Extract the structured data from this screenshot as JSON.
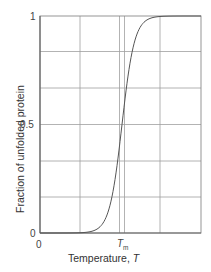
{
  "chart_data": {
    "type": "line",
    "title": "",
    "xlabel": "Temperature, T",
    "ylabel": "Fraction of unfolded protein",
    "x_tick_labels": [
      "0",
      "Tm"
    ],
    "y_tick_labels": [
      "0",
      "0.5",
      "1"
    ],
    "ylim": [
      0,
      1
    ],
    "xlim": [
      0,
      1
    ],
    "grid": true,
    "annotations": [
      {
        "text": "Tm",
        "x": 0.5,
        "description": "melting temperature, where fraction unfolded = 0.5"
      }
    ],
    "series": [
      {
        "name": "Fraction of unfolded protein",
        "x": [
          0.0,
          0.1,
          0.2,
          0.3,
          0.35,
          0.4,
          0.45,
          0.48,
          0.5,
          0.52,
          0.55,
          0.6,
          0.65,
          0.7,
          0.8,
          0.9,
          1.0
        ],
        "values": [
          0.0,
          0.003,
          0.01,
          0.03,
          0.06,
          0.12,
          0.25,
          0.38,
          0.5,
          0.62,
          0.75,
          0.87,
          0.93,
          0.96,
          0.985,
          0.995,
          1.0
        ]
      }
    ],
    "colors": {
      "curve": "#555555",
      "grid": "#9a9a9a",
      "axis": "#666666"
    }
  },
  "labels": {
    "y_axis": "Fraction of unfolded protein",
    "x_axis_main": "Temperature, ",
    "x_axis_var": "T",
    "y_tick_1": "1",
    "y_tick_half": "0.5",
    "y_tick_0": "0",
    "x_tick_0": "0",
    "x_tick_tm": "T",
    "x_tick_tm_sub": "m"
  }
}
